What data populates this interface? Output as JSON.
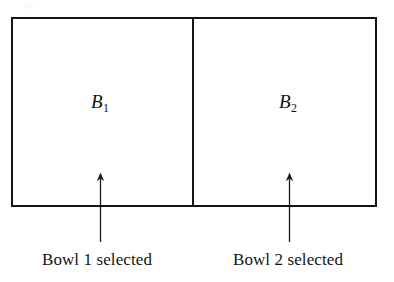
{
  "figure": {
    "background_color": "#ffffff",
    "ink_color": "#151515",
    "width": 394,
    "height": 282
  },
  "sample_space": {
    "name": "partitioned-sample-space",
    "regions": [
      {
        "id": "bowl-1",
        "label_base": "B",
        "label_subscript": "1",
        "caption": "Bowl 1 selected"
      },
      {
        "id": "bowl-2",
        "label_base": "B",
        "label_subscript": "2",
        "caption": "Bowl 2 selected"
      }
    ]
  },
  "arrows": [
    {
      "id": "arrow-bowl-1",
      "direction": "up",
      "points_to": "B1"
    },
    {
      "id": "arrow-bowl-2",
      "direction": "up",
      "points_to": "B2"
    }
  ]
}
